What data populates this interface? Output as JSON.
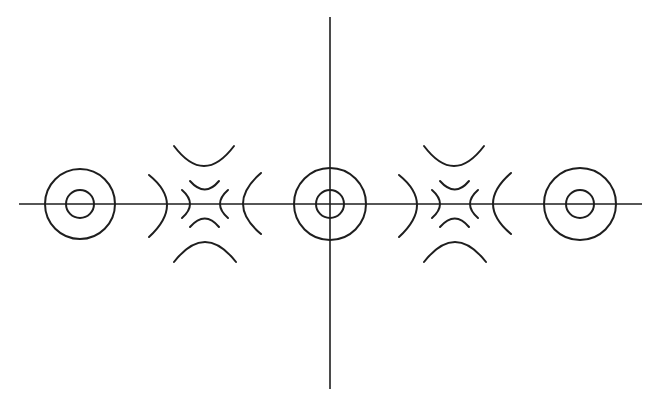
{
  "diagram": {
    "stroke_color": "#1e1e1e",
    "background": "#ffffff",
    "axes": {
      "horizontal": {
        "x1": 19,
        "x2": 642,
        "y": 204
      },
      "vertical": {
        "x": 330,
        "y1": 17,
        "y2": 389
      }
    },
    "concentric_circles": [
      {
        "cx": 80,
        "cy": 204,
        "r_outer": 35,
        "r_inner": 14
      },
      {
        "cx": 330,
        "cy": 204,
        "r_outer": 36,
        "r_inner": 14
      },
      {
        "cx": 580,
        "cy": 204,
        "r_outer": 36,
        "r_inner": 14
      }
    ],
    "arc_clusters": [
      {
        "cx": 205,
        "cy": 204
      },
      {
        "cx": 455,
        "cy": 204
      }
    ]
  }
}
